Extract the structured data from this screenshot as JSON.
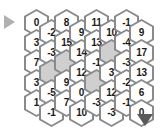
{
  "widget": {
    "title": "Hex Number Grid",
    "background_color": "#ffffff",
    "hex_border_color": "#8a8a8a",
    "hex_fill_color": "#ffffff",
    "hex_blocked_color": "#cfcfcf",
    "text_color": "#1a1a1a"
  },
  "controls": {
    "scroll_left_arrow": {
      "name": "left-arrow",
      "glyph": "▶",
      "color": "#b0b0b0",
      "direction": "right"
    },
    "scroll_down_arrow": {
      "name": "down-arrow",
      "glyph": "▼",
      "color": "#5a5a5a",
      "direction": "down"
    }
  },
  "grid": {
    "columns": 8,
    "rows": 5,
    "orientation": "pointy-top-offset-columns",
    "offset_rule": "odd columns raised, even columns lowered",
    "cells": [
      {
        "col": 1,
        "row": 1,
        "value": "0",
        "blocked": false
      },
      {
        "col": 1,
        "row": 2,
        "value": "3",
        "blocked": false
      },
      {
        "col": 1,
        "row": 3,
        "value": "7",
        "blocked": false
      },
      {
        "col": 1,
        "row": 4,
        "value": "3",
        "blocked": false
      },
      {
        "col": 1,
        "row": 5,
        "value": "1",
        "blocked": false
      },
      {
        "col": 2,
        "row": 1,
        "value": "-2",
        "blocked": false
      },
      {
        "col": 2,
        "row": 2,
        "value": "-3",
        "blocked": false
      },
      {
        "col": 2,
        "row": 3,
        "value": "",
        "blocked": true
      },
      {
        "col": 2,
        "row": 4,
        "value": "-5",
        "blocked": false
      },
      {
        "col": 2,
        "row": 5,
        "value": "-1",
        "blocked": false
      },
      {
        "col": 3,
        "row": 1,
        "value": "8",
        "blocked": false
      },
      {
        "col": 3,
        "row": 2,
        "value": "15",
        "blocked": false
      },
      {
        "col": 3,
        "row": 3,
        "value": "",
        "blocked": true
      },
      {
        "col": 3,
        "row": 4,
        "value": "9",
        "blocked": false
      },
      {
        "col": 3,
        "row": 5,
        "value": "7",
        "blocked": false
      },
      {
        "col": 4,
        "row": 1,
        "value": "9",
        "blocked": false
      },
      {
        "col": 4,
        "row": 2,
        "value": "14",
        "blocked": false
      },
      {
        "col": 4,
        "row": 3,
        "value": "12",
        "blocked": false
      },
      {
        "col": 4,
        "row": 4,
        "value": "0",
        "blocked": false
      },
      {
        "col": 4,
        "row": 5,
        "value": "10",
        "blocked": false
      },
      {
        "col": 5,
        "row": 1,
        "value": "11",
        "blocked": false
      },
      {
        "col": 5,
        "row": 2,
        "value": "13",
        "blocked": false
      },
      {
        "col": 5,
        "row": 3,
        "value": "-1",
        "blocked": false
      },
      {
        "col": 5,
        "row": 4,
        "value": "",
        "blocked": true
      },
      {
        "col": 5,
        "row": 5,
        "value": "-3",
        "blocked": false
      },
      {
        "col": 6,
        "row": 1,
        "value": "10",
        "blocked": false
      },
      {
        "col": 6,
        "row": 2,
        "value": "",
        "blocked": true
      },
      {
        "col": 6,
        "row": 3,
        "value": "3",
        "blocked": false
      },
      {
        "col": 6,
        "row": 4,
        "value": "12",
        "blocked": false
      },
      {
        "col": 6,
        "row": 5,
        "value": "-3",
        "blocked": false
      },
      {
        "col": 7,
        "row": 1,
        "value": "-1",
        "blocked": false
      },
      {
        "col": 7,
        "row": 2,
        "value": "-4",
        "blocked": false
      },
      {
        "col": 7,
        "row": 3,
        "value": "-3",
        "blocked": false
      },
      {
        "col": 7,
        "row": 4,
        "value": "-2",
        "blocked": false
      },
      {
        "col": 7,
        "row": 5,
        "value": "-1",
        "blocked": false
      },
      {
        "col": 8,
        "row": 1,
        "value": "9",
        "blocked": false
      },
      {
        "col": 8,
        "row": 2,
        "value": "17",
        "blocked": false
      },
      {
        "col": 8,
        "row": 3,
        "value": "13",
        "blocked": false
      },
      {
        "col": 8,
        "row": 4,
        "value": "6",
        "blocked": false
      },
      {
        "col": 8,
        "row": 5,
        "value": "0",
        "blocked": false
      }
    ]
  }
}
